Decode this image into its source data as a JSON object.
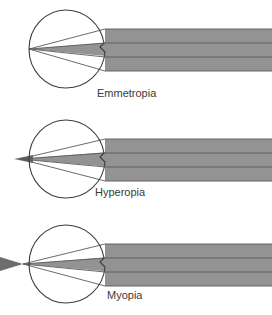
{
  "figure": {
    "background_color": "#ffffff",
    "width": 272,
    "height": 315,
    "beam_fill": "#939393",
    "beam_ray_line": "#5a5a5a",
    "eye_outline": "#3d3d3d",
    "label_color": "#3a3a3a",
    "beam_right_edge_x": 272
  },
  "diagrams": [
    {
      "id": "emmetropia",
      "label": "Emmetropia",
      "label_x": 97,
      "label_y": 97,
      "eye": {
        "cx": 66,
        "cy": 49,
        "r": 39
      },
      "focus": {
        "x": 29,
        "y": 49
      },
      "description": "Parallel rays focus precisely on the retina",
      "beam": {
        "top_y": 29,
        "bottom_y": 71,
        "entry_x": 105
      },
      "tail": "none"
    },
    {
      "id": "hyperopia",
      "label": "Hyperopia",
      "label_x": 95,
      "label_y": 196,
      "eye": {
        "cx": 66,
        "cy": 159,
        "r": 39
      },
      "focus": {
        "x": 20,
        "y": 159
      },
      "description": "Parallel rays focus behind the retina",
      "beam": {
        "top_y": 139,
        "bottom_y": 181,
        "entry_x": 105
      },
      "tail": "left-short"
    },
    {
      "id": "myopia",
      "label": "Myopia",
      "label_x": 107,
      "label_y": 299,
      "eye": {
        "cx": 66,
        "cy": 264,
        "r": 39
      },
      "focus": {
        "x": 23,
        "y": 264
      },
      "description": "Parallel rays focus in front of the retina",
      "beam": {
        "top_y": 244,
        "bottom_y": 286,
        "entry_x": 105
      },
      "tail": "left-diverging"
    }
  ]
}
